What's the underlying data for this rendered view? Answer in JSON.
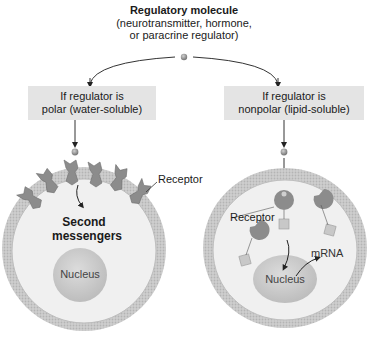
{
  "title": {
    "heading": "Regulatory molecule",
    "line2": "(neurotransmitter, hormone,",
    "line3": "or paracrine regulator)"
  },
  "branches": [
    {
      "condition_line1": "If regulator is",
      "condition_line2": "polar (water-soluble)",
      "labels": {
        "receptor": "Receptor",
        "second_line1": "Second",
        "second_line2": "messengers",
        "nucleus": "Nucleus"
      }
    },
    {
      "condition_line1": "If regulator is",
      "condition_line2": "nonpolar (lipid-soluble)",
      "labels": {
        "receptor": "Receptor",
        "mrna": "mRNA",
        "nucleus": "Nucleus"
      }
    }
  ],
  "colors": {
    "box_bg": "#e4e4e4",
    "membrane": "#c8c8c8",
    "cytoplasm": "#ececec",
    "receptor": "#8a8a8a",
    "nucleus": "#cfcfcf",
    "molecule": "#9a9a9a"
  }
}
